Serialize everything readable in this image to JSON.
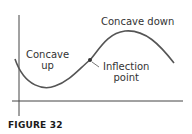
{
  "figure": {
    "caption": "FIGURE 32",
    "labels": {
      "concave_up": "Concave\nup",
      "concave_up_line1": "Concave",
      "concave_up_line2": "up",
      "concave_down": "Concave down",
      "inflection_line1": "Inflection",
      "inflection_line2": "point"
    },
    "colors": {
      "curve": "#555555",
      "axes": "#444444",
      "text": "#333333"
    }
  }
}
